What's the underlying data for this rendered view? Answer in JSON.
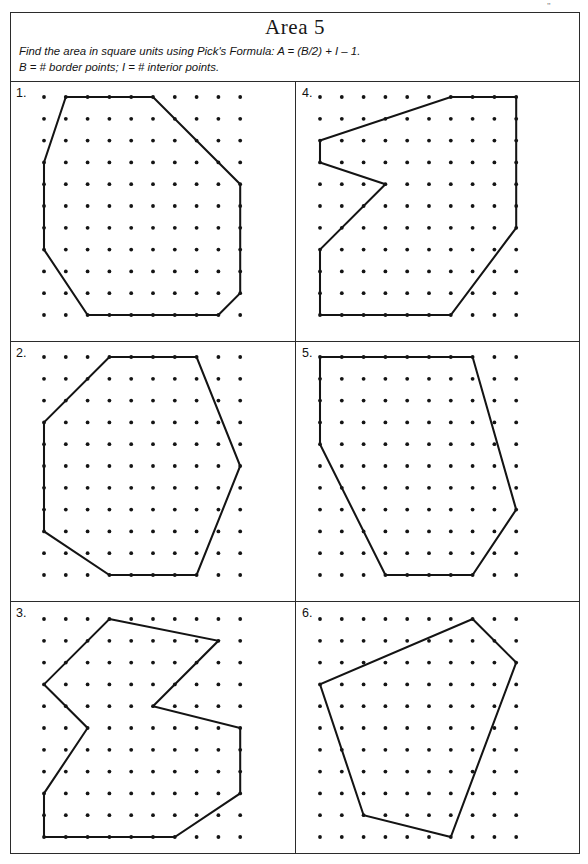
{
  "page": {
    "corner_mark": "\"",
    "title": "Area 5",
    "instruction_line1": "Find the area in square units using Pick's Formula: A = (B/2) + I – 1.",
    "instruction_line2": "B = # border points; I = # interior points."
  },
  "grid": {
    "columns": 10,
    "rows": 11,
    "spacing_px": 21.8,
    "dot_radius_px": 1.9,
    "dot_color": "#141414",
    "line_color": "#141414"
  },
  "problems": [
    {
      "number": "1.",
      "shape": "octagon",
      "origin_x": 34,
      "origin_y": 15,
      "vertices": [
        [
          1,
          0
        ],
        [
          5,
          0
        ],
        [
          9,
          4
        ],
        [
          9,
          9
        ],
        [
          8,
          10
        ],
        [
          2,
          10
        ],
        [
          0,
          7
        ],
        [
          0,
          3
        ]
      ]
    },
    {
      "number": "2.",
      "shape": "heptagon",
      "origin_x": 34,
      "origin_y": 15,
      "vertices": [
        [
          3,
          0
        ],
        [
          7,
          0
        ],
        [
          9,
          5
        ],
        [
          7,
          10
        ],
        [
          3,
          10
        ],
        [
          0,
          8
        ],
        [
          0,
          3
        ]
      ]
    },
    {
      "number": "3.",
      "shape": "concave-decagon",
      "origin_x": 34,
      "origin_y": 17,
      "vertices": [
        [
          3,
          0
        ],
        [
          8,
          1
        ],
        [
          5,
          4
        ],
        [
          9,
          5
        ],
        [
          9,
          8
        ],
        [
          6,
          10
        ],
        [
          0,
          10
        ],
        [
          0,
          8
        ],
        [
          2,
          5
        ],
        [
          0,
          3
        ]
      ]
    },
    {
      "number": "4.",
      "shape": "concave-nonagon",
      "origin_x": 24,
      "origin_y": 15,
      "vertices": [
        [
          6,
          0
        ],
        [
          9,
          0
        ],
        [
          9,
          6
        ],
        [
          6,
          10
        ],
        [
          0,
          10
        ],
        [
          0,
          7
        ],
        [
          3,
          4
        ],
        [
          0,
          3
        ],
        [
          0,
          2
        ]
      ]
    },
    {
      "number": "5.",
      "shape": "hexagon",
      "origin_x": 24,
      "origin_y": 15,
      "vertices": [
        [
          0,
          0
        ],
        [
          7,
          0
        ],
        [
          9,
          7
        ],
        [
          7,
          10
        ],
        [
          3,
          10
        ],
        [
          0,
          4
        ]
      ]
    },
    {
      "number": "6.",
      "shape": "pentagon",
      "origin_x": 24,
      "origin_y": 17,
      "vertices": [
        [
          7,
          0
        ],
        [
          9,
          2
        ],
        [
          6,
          10
        ],
        [
          2,
          9
        ],
        [
          0,
          3
        ]
      ]
    }
  ]
}
